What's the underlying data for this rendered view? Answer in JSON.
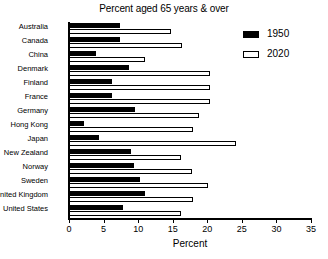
{
  "chart_data": {
    "type": "bar",
    "orientation": "horizontal",
    "title": "Percent aged 65 years & over",
    "xlabel": "Percent",
    "ylabel": "",
    "xlim": [
      0,
      35
    ],
    "xticks": [
      0,
      5,
      10,
      15,
      20,
      25,
      30,
      35
    ],
    "grid": false,
    "legend_position": "top-right",
    "categories": [
      "Australia",
      "Canada",
      "China",
      "Denmark",
      "Finland",
      "France",
      "Germany",
      "Hong Kong",
      "Japan",
      "New Zealand",
      "Norway",
      "Sweden",
      "United Kingdom",
      "United States"
    ],
    "series": [
      {
        "name": "1950",
        "color": "#000000",
        "values": [
          7.4,
          7.4,
          3.9,
          8.7,
          6.2,
          6.2,
          9.5,
          2.2,
          4.4,
          9.0,
          9.4,
          10.3,
          11.0,
          7.8
        ]
      },
      {
        "name": "2020",
        "color": "#ffffff",
        "values": [
          14.8,
          16.3,
          11.0,
          20.4,
          20.4,
          20.4,
          18.8,
          18.0,
          24.2,
          16.2,
          17.8,
          20.1,
          18.0,
          16.2
        ]
      }
    ]
  }
}
